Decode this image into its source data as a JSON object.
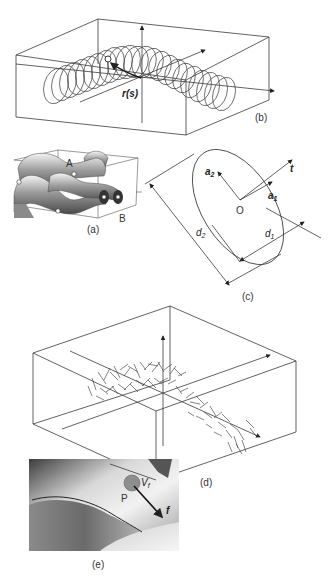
{
  "figure": {
    "panels": [
      {
        "id": "a",
        "label": "(a)",
        "description": "3D rendered tubular surfaces crossing inside a bounding box",
        "points": {
          "A": "A",
          "B": "B"
        }
      },
      {
        "id": "b",
        "label": "(b)",
        "description": "Helical coil of ellipses swept along a curve within a 3D box",
        "vector_label": "r(s)",
        "origin_label": "O"
      },
      {
        "id": "c",
        "label": "(c)",
        "description": "Ellipse cross-section with axes and diameters",
        "labels": {
          "origin": "O",
          "a1": "a",
          "a1_sub": "1",
          "a2": "a",
          "a2_sub": "2",
          "t": "t",
          "d1": "d",
          "d1_sub": "1",
          "d2": "d",
          "d2_sub": "2"
        }
      },
      {
        "id": "d",
        "label": "(d)",
        "description": "Scattered short line segments (vector field) along a curve inside a 3D box"
      },
      {
        "id": "e",
        "label": "(e)",
        "description": "Shaded surface close-up with point P, volume V and force f",
        "labels": {
          "P": "P",
          "V": "V",
          "V_sub": "f",
          "f": "f"
        }
      }
    ]
  }
}
